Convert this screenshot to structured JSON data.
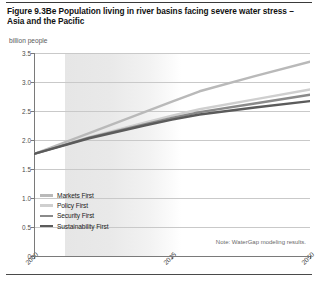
{
  "figure": {
    "title": "Figure 9.3Be Population living in river basins facing severe water stress – Asia and the Pacific",
    "note": "Note: WaterGap modeling results."
  },
  "chart_data": {
    "type": "line",
    "title": "Figure 9.3Be Population living in river basins facing severe water stress – Asia and the Pacific",
    "xlabel": "",
    "ylabel": "billion people",
    "ylim": [
      0,
      3.5
    ],
    "xlim": [
      2000,
      2050
    ],
    "grid": true,
    "legend_position": "bottom-left",
    "yticks": [
      "0",
      "0.5",
      "1.0",
      "1.5",
      "2.0",
      "2.5",
      "3.0",
      "3.5"
    ],
    "ytick_values": [
      0,
      0.5,
      1.0,
      1.5,
      2.0,
      2.5,
      3.0,
      3.5
    ],
    "xticks": [
      "2000",
      "2025",
      "2050"
    ],
    "xtick_values": [
      2000,
      2025,
      2050
    ],
    "x": [
      2000,
      2010,
      2020,
      2025,
      2030,
      2040,
      2050
    ],
    "series": [
      {
        "name": "Markets First",
        "color": "#b9b9b9",
        "values": [
          1.76,
          2.12,
          2.48,
          2.66,
          2.84,
          3.1,
          3.35
        ]
      },
      {
        "name": "Policy First",
        "color": "#cfcfcf",
        "values": [
          1.76,
          2.05,
          2.3,
          2.42,
          2.53,
          2.7,
          2.87
        ]
      },
      {
        "name": "Security First",
        "color": "#8a8a8a",
        "values": [
          1.76,
          2.04,
          2.27,
          2.38,
          2.48,
          2.63,
          2.78
        ]
      },
      {
        "name": "Sustainability First",
        "color": "#5b5b5b",
        "values": [
          1.76,
          2.03,
          2.25,
          2.35,
          2.44,
          2.56,
          2.67
        ]
      }
    ],
    "annotations": [
      "Note: WaterGap modeling results."
    ],
    "shaded_region": {
      "from": 2000,
      "to": 2021,
      "label": "historical"
    }
  },
  "axis": {
    "y": {
      "label": "billion people",
      "ticks": [
        {
          "label": "3.5",
          "value": 3.5
        },
        {
          "label": "3.0",
          "value": 3.0
        },
        {
          "label": "2.5",
          "value": 2.5
        },
        {
          "label": "2.0",
          "value": 2.0
        },
        {
          "label": "1.5",
          "value": 1.5
        },
        {
          "label": "1.0",
          "value": 1.0
        },
        {
          "label": "0.5",
          "value": 0.5
        },
        {
          "label": "0",
          "value": 0
        }
      ]
    },
    "x": {
      "ticks": [
        {
          "label": "2000",
          "value": 2000
        },
        {
          "label": "2025",
          "value": 2025
        },
        {
          "label": "2050",
          "value": 2050
        }
      ]
    }
  },
  "legend": {
    "items": [
      {
        "label": "Markets First",
        "color": "#b9b9b9"
      },
      {
        "label": "Policy First",
        "color": "#cfcfcf"
      },
      {
        "label": "Security First",
        "color": "#8a8a8a"
      },
      {
        "label": "Sustainability First",
        "color": "#5b5b5b"
      }
    ]
  }
}
